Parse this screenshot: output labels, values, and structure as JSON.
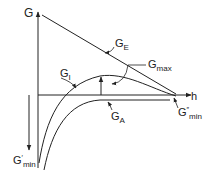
{
  "diagram": {
    "axes": {
      "y_label": "G",
      "x_label": "h"
    },
    "curves": [
      {
        "id": "G_E",
        "label_main": "G",
        "label_sub": "E"
      },
      {
        "id": "G_I",
        "label_main": "G",
        "label_sub": "I"
      },
      {
        "id": "G_A",
        "label_main": "G",
        "label_sub": "A"
      }
    ],
    "annotations": [
      {
        "id": "G_max",
        "label_main": "G",
        "label_sub": "max"
      },
      {
        "id": "G_min_double_prime",
        "label_main": "G",
        "label_sup": "″",
        "label_sub": "min"
      },
      {
        "id": "G_min_prime",
        "label_main": "G",
        "label_sup": "′",
        "label_sub": "min"
      }
    ],
    "colors": {
      "line": "#222222",
      "background": "#ffffff"
    }
  }
}
